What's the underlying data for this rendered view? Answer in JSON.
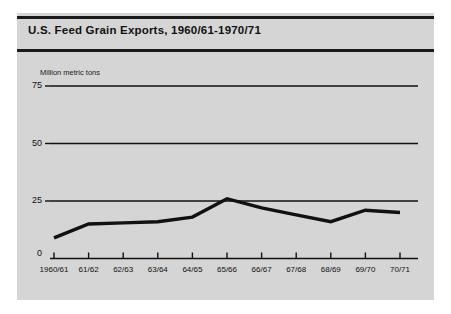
{
  "figure": {
    "title": "U.S. Feed Grain Exports, 1960/61-1970/71",
    "panel_color": "#d5d5d5",
    "page_color": "#ffffff",
    "rule_color": "#1a1a1a",
    "line_color": "#111111",
    "grid_color": "#111111"
  },
  "chart_data": {
    "type": "line",
    "title": "U.S. Feed Grain Exports, 1960/61-1970/71",
    "xlabel": "",
    "ylabel": "Million metric tons",
    "categories": [
      "1960/61",
      "61/62",
      "62/63",
      "63/64",
      "64/65",
      "65/66",
      "66/67",
      "67/68",
      "68/69",
      "69/70",
      "70/71"
    ],
    "values": [
      9,
      15,
      15.5,
      16,
      18,
      26,
      22,
      19,
      16,
      21,
      20
    ],
    "ylim": [
      0,
      75
    ],
    "yticks": [
      0,
      25,
      50,
      75
    ],
    "ytick_labels": [
      "0",
      "25",
      "50",
      "75"
    ],
    "grid": "horizontal",
    "legend": "none",
    "series": [
      {
        "name": "U.S. feed grain exports",
        "values": [
          9,
          15,
          15.5,
          16,
          18,
          26,
          22,
          19,
          16,
          21,
          20
        ]
      }
    ]
  }
}
